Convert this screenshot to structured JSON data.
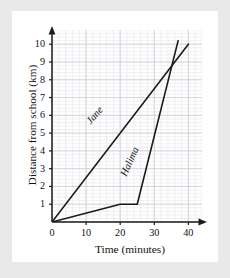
{
  "page": {
    "background_color": "#e9e9e9",
    "paper_color": "#ffffff"
  },
  "chart_data": {
    "type": "line",
    "title": "",
    "xlabel": "Time (minutes)",
    "ylabel": "Distance from school (km)",
    "xlim": [
      0,
      44
    ],
    "ylim": [
      0,
      10.8
    ],
    "xticks": [
      0,
      10,
      20,
      30,
      40
    ],
    "xtick_labels": [
      "0",
      "10",
      "20",
      "30",
      "40"
    ],
    "yticks": [
      1,
      2,
      3,
      4,
      5,
      6,
      7,
      8,
      9,
      10
    ],
    "ytick_labels": [
      "1",
      "2",
      "3",
      "4",
      "5",
      "6",
      "7",
      "8",
      "9",
      "10"
    ],
    "grid": true,
    "grid_major_step_x": 10,
    "grid_major_step_y": 1,
    "grid_minor_step_x": 2,
    "grid_minor_step_y": 0.2,
    "grid_major_color": "#c8c8cf",
    "grid_minor_color": "#e6e6ec",
    "axis_color": "#1a1a1a",
    "line_color": "#1a1a1a",
    "legend": "inline-labels",
    "series": [
      {
        "name": "Jane",
        "label": "Jane",
        "x": [
          0,
          40
        ],
        "y": [
          0,
          10
        ],
        "points": [
          [
            0,
            0
          ],
          [
            40,
            10
          ]
        ]
      },
      {
        "name": "Halima",
        "label": "Halima",
        "x": [
          0,
          20,
          25,
          37
        ],
        "y": [
          0,
          1,
          1,
          10.2
        ],
        "points": [
          [
            0,
            0
          ],
          [
            20,
            1
          ],
          [
            25,
            1
          ],
          [
            37,
            10.2
          ]
        ]
      }
    ]
  }
}
